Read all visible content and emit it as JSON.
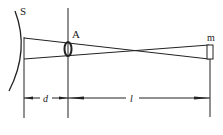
{
  "diagram": {
    "labels": {
      "surface": "S",
      "lens": "A",
      "target": "m",
      "distance_d": "d",
      "distance_l": "l"
    },
    "colors": {
      "stroke": "#222222",
      "background": "#ffffff"
    }
  }
}
